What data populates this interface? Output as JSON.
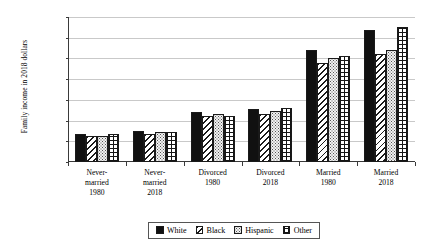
{
  "chart_data": {
    "type": "bar",
    "title": "",
    "xlabel": "",
    "ylabel": "Family income in 2018 dollars",
    "ylim": [
      0,
      140000
    ],
    "ytick_values": [
      0,
      20000,
      40000,
      60000,
      80000,
      100000,
      120000,
      140000
    ],
    "ytick_labels": [
      "0",
      "$20,000",
      "$40,000",
      "$60,000",
      "$80,000",
      "$100,000",
      "$120,000",
      "$140,000"
    ],
    "grid": true,
    "legend_position": "bottom",
    "categories": [
      "Never-married 1980",
      "Never-married 2018",
      "Divorced 1980",
      "Divorced 2018",
      "Married 1980",
      "Married 2018"
    ],
    "category_lines": [
      [
        "Never-",
        "married",
        "1980"
      ],
      [
        "Never-",
        "married",
        "2018"
      ],
      [
        "Divorced",
        "1980"
      ],
      [
        "Divorced",
        "2018"
      ],
      [
        "Married",
        "1980"
      ],
      [
        "Married",
        "2018"
      ]
    ],
    "series": [
      {
        "name": "White",
        "pattern": "solid-black",
        "values": [
          27500,
          30000,
          48000,
          51000,
          108500,
          127000
        ]
      },
      {
        "name": "Black",
        "pattern": "diagonal-hatch",
        "values": [
          25500,
          27500,
          44000,
          46000,
          95500,
          104000
        ]
      },
      {
        "name": "Hispanic",
        "pattern": "fine-dots",
        "values": [
          25500,
          28500,
          46500,
          49500,
          100500,
          108500
        ]
      },
      {
        "name": "Other",
        "pattern": "crosshatch-grid",
        "values": [
          27000,
          28500,
          44000,
          52000,
          102500,
          130500
        ]
      }
    ]
  },
  "colors": {
    "axis": "#3a3a3a",
    "gridline": "#c9c9c9",
    "series_white": "#111111",
    "series_black": "#ffffff",
    "series_hispanic": "#f2f2f2",
    "series_other": "#ffffff",
    "background": "#ffffff"
  }
}
